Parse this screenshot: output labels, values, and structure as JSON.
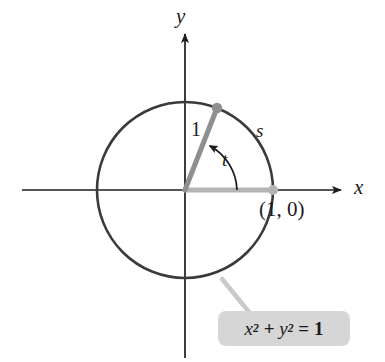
{
  "figure": {
    "axes": {
      "x_label": "x",
      "y_label": "y",
      "x_axis": {
        "x1": 22,
        "y1": 190,
        "x2": 345,
        "y2": 190
      },
      "y_axis": {
        "x1": 185,
        "y1": 358,
        "x2": 185,
        "y2": 30
      },
      "origin": {
        "x": 185,
        "y": 190
      }
    },
    "circle": {
      "center_x": 185,
      "center_y": 190,
      "radius": 88,
      "stroke": "#3a3a3a",
      "stroke_width": 2.6,
      "equation_label": "x² + y² = 1"
    },
    "radius_segment": {
      "label": "1",
      "from": {
        "x": 185,
        "y": 190
      },
      "to": {
        "x": 217,
        "y": 108
      },
      "angle_degrees": 68,
      "stroke": "#8f8f8f",
      "stroke_width": 5
    },
    "initial_side": {
      "label": "(1, 0)",
      "from": {
        "x": 185,
        "y": 190
      },
      "to": {
        "x": 273,
        "y": 190
      },
      "stroke": "#b4b4b4",
      "stroke_width": 5
    },
    "terminal_point": {
      "x": 217,
      "y": 108,
      "fill": "#8f8f8f",
      "r": 5
    },
    "unit_point": {
      "x": 273,
      "y": 190,
      "fill": "#b4b4b4",
      "r": 5
    },
    "angle": {
      "label": "t",
      "arc_radius": 52,
      "start_degrees": 0,
      "end_degrees": 62,
      "stroke": "#1c1c1c"
    },
    "arc": {
      "label": "s",
      "description": "arc length from (1,0) to terminal point"
    },
    "callout": {
      "text_prefix": "x",
      "text_exp1": "2",
      "text_plus": " + ",
      "text_var2": "y",
      "text_exp2": "2",
      "text_equals": " = ",
      "text_value": "1",
      "background": "#d6d6d6",
      "leader_from": {
        "x": 222,
        "y": 279
      },
      "leader_to": {
        "x": 249,
        "y": 312
      },
      "leader_stroke": "#c9c9c9"
    },
    "colors": {
      "ink": "#1c1c1c",
      "circle_stroke": "#3a3a3a",
      "gray_radius": "#8f8f8f",
      "light_gray": "#b4b4b4",
      "callout_bg": "#d6d6d6",
      "background": "#ffffff"
    }
  }
}
